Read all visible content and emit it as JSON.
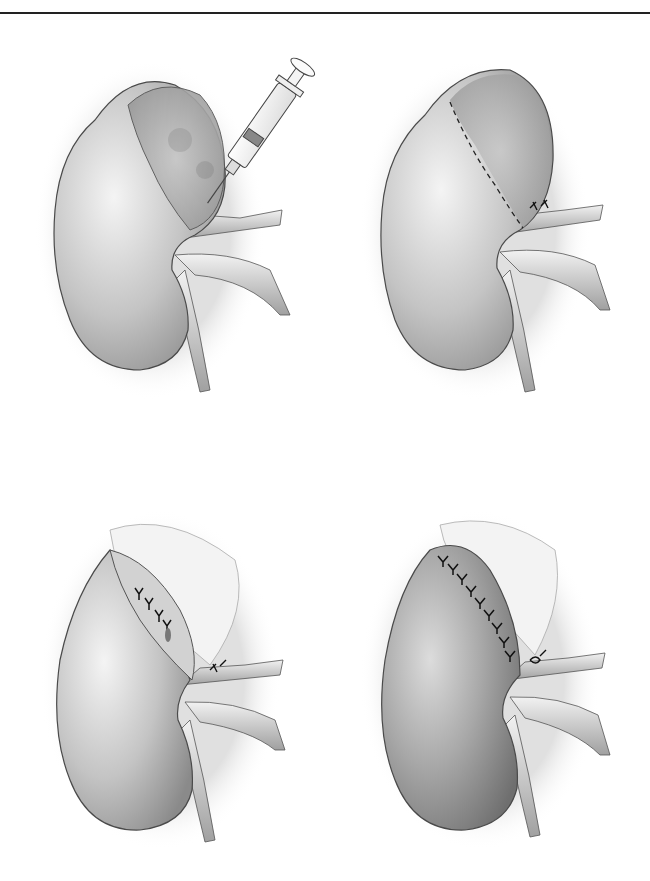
{
  "page": {
    "header_text": "",
    "background": "#ffffff",
    "rule_color": "#222222"
  },
  "figure": {
    "panels": [
      {
        "id": "a",
        "description": "kidney with upper-pole lesion, syringe injecting near hilum"
      },
      {
        "id": "b",
        "description": "kidney with dashed resection line across upper pole, vessels ligated"
      },
      {
        "id": "c",
        "description": "upper pole resected, collecting system closed with sutures"
      },
      {
        "id": "d",
        "description": "parenchymal edges approximated with interrupted sutures"
      }
    ],
    "colors": {
      "kidney_fill_light": "#e6e6e6",
      "kidney_fill_dark": "#8e8e8e",
      "outline": "#4a4a4a",
      "suture": "#1a1a1a",
      "halo": "#d8d8d8"
    }
  }
}
